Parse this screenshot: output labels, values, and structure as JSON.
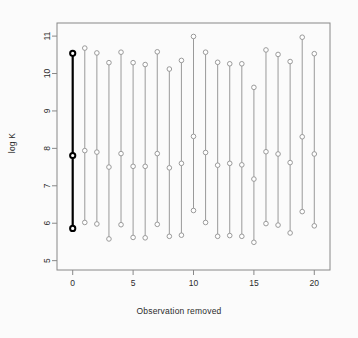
{
  "chart_data": {
    "type": "scatter",
    "title": "",
    "subtitle": "",
    "xlabel": "Observation removed",
    "ylabel": "log K",
    "xlim": [
      -1.3,
      21.3
    ],
    "ylim": [
      4.75,
      11.35
    ],
    "xticks": [
      0,
      5,
      10,
      15,
      20
    ],
    "yticks": [
      5,
      6,
      7,
      8,
      9,
      10,
      11
    ],
    "grid": false,
    "legend": null,
    "annotations": [
      "Observation 0 (full data, no observation removed) is drawn as a bold black segment with filled endpoints."
    ],
    "point_marker": "open-circle",
    "series": [
      {
        "name": "upper bound",
        "values": [
          10.54,
          10.68,
          10.55,
          10.29,
          10.57,
          10.29,
          10.24,
          10.58,
          10.12,
          10.35,
          10.99,
          10.57,
          10.3,
          10.26,
          10.26,
          9.63,
          10.63,
          10.51,
          10.32,
          10.97,
          10.53
        ]
      },
      {
        "name": "point estimate",
        "values": [
          7.81,
          7.94,
          7.9,
          7.5,
          7.86,
          7.52,
          7.52,
          7.86,
          7.48,
          7.6,
          8.32,
          7.89,
          7.55,
          7.6,
          7.56,
          7.18,
          7.91,
          7.85,
          7.62,
          8.31,
          7.85
        ]
      },
      {
        "name": "lower bound",
        "values": [
          5.86,
          6.02,
          5.98,
          5.58,
          5.96,
          5.62,
          5.61,
          5.97,
          5.65,
          5.68,
          6.34,
          6.02,
          5.65,
          5.67,
          5.65,
          5.49,
          5.99,
          5.95,
          5.74,
          6.31,
          5.93
        ]
      }
    ],
    "x": [
      0,
      1,
      2,
      3,
      4,
      5,
      6,
      7,
      8,
      9,
      10,
      11,
      12,
      13,
      14,
      15,
      16,
      17,
      18,
      19,
      20
    ],
    "highlight_index": 0,
    "colors": {
      "highlight": "#000000",
      "normal": "#9a9a9a",
      "axis": "#888888",
      "text": "#2b2b2b",
      "background": "#fbfbfb"
    }
  }
}
